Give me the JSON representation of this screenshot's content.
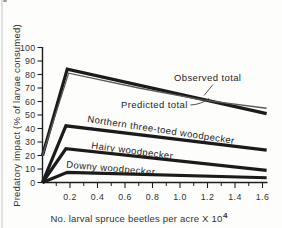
{
  "page": {
    "background_color": "#fdfdfc",
    "scan_edge_color": "#dcdcdc"
  },
  "chart_data": {
    "type": "line",
    "title": "",
    "xlabel": "No. larval spruce beetles per acre X 10",
    "xlabel_superscript": "4",
    "ylabel": "Predatory impact (% of larvae consumed)",
    "xlim": [
      0,
      1.65
    ],
    "ylim": [
      0,
      100
    ],
    "x_major_tick_labels": [
      "0.2",
      "0.4",
      "0.6",
      "0.8",
      "1.0",
      "1.2",
      "1.4",
      "1.6"
    ],
    "x_major_tick_values": [
      0.2,
      0.4,
      0.6,
      0.8,
      1.0,
      1.2,
      1.4,
      1.6
    ],
    "x_minor_tick_values": [
      0.1,
      0.3,
      0.5,
      0.7,
      0.9,
      1.1,
      1.3,
      1.5
    ],
    "y_tick_labels": [
      "0",
      "10",
      "20",
      "30",
      "40",
      "50",
      "60",
      "70",
      "80",
      "90",
      "100"
    ],
    "y_tick_values": [
      0,
      10,
      20,
      30,
      40,
      50,
      60,
      70,
      80,
      90,
      100
    ],
    "grid": false,
    "legend_position": "inline-annotations",
    "axis_color": "#1d1d1d",
    "line_color": "#1b1b1b",
    "observed_line_color": "#5a5a5a",
    "text_color": "#333333",
    "series": [
      {
        "name": "Predicted total",
        "stroke": "thick",
        "points": [
          [
            0,
            20
          ],
          [
            0.18,
            84
          ],
          [
            1.63,
            51
          ]
        ]
      },
      {
        "name": "Northern three-toed woodpecker",
        "stroke": "thick",
        "points": [
          [
            0,
            0
          ],
          [
            0.17,
            42
          ],
          [
            1.63,
            24
          ]
        ]
      },
      {
        "name": "Hairy woodpecker",
        "stroke": "thick",
        "points": [
          [
            0,
            0
          ],
          [
            0.17,
            25
          ],
          [
            1.63,
            9
          ]
        ]
      },
      {
        "name": "Downy woodpecker",
        "stroke": "thick",
        "points": [
          [
            0,
            0
          ],
          [
            0.18,
            7.5
          ],
          [
            1.63,
            3.5
          ]
        ]
      },
      {
        "name": "Observed total",
        "stroke": "thin",
        "points": [
          [
            0,
            20
          ],
          [
            0.19,
            81
          ],
          [
            0.7,
            70
          ],
          [
            1.17,
            61
          ],
          [
            1.63,
            55
          ]
        ]
      }
    ],
    "annotations": [
      {
        "id": "observed-total-label",
        "text": "Observed total",
        "px": [
          174,
          81
        ],
        "rotate": 0,
        "leader": [
          [
            213,
            84.5
          ],
          [
            204,
            95.5
          ]
        ]
      },
      {
        "id": "predicted-total-label",
        "text": "Predicted total",
        "px": [
          121,
          107.5
        ],
        "rotate": 0,
        "leader_curve": [
          [
            190.5,
            105
          ],
          [
            201,
            104.5
          ],
          [
            209,
            98.5
          ]
        ]
      },
      {
        "id": "northern-three-toed-woodpecker-label",
        "text": "Northern three-toed woodpecker",
        "px": [
          87,
          122
        ],
        "rotate": 8.5
      },
      {
        "id": "hairy-woodpecker-label",
        "text": "Hairy woodpecker",
        "px": [
          91,
          148.5
        ],
        "rotate": 7.5
      },
      {
        "id": "downy-woodpecker-label",
        "text": "Downy woodpecker",
        "px": [
          66,
          167.5
        ],
        "rotate": 5
      }
    ]
  }
}
